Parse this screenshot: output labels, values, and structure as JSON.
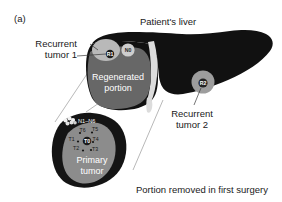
{
  "figure": {
    "panel_label": "(a)",
    "title": "Patient's liver",
    "caption": "Portion removed in first surgery"
  },
  "callouts": {
    "recurrent_tumor_1_line1": "Recurrent",
    "recurrent_tumor_1_line2": "tumor 1",
    "recurrent_tumor_2_line1": "Recurrent",
    "recurrent_tumor_2_line2": "tumor 2"
  },
  "regions": {
    "regenerated_line1": "Regenerated",
    "regenerated_line2": "portion",
    "primary_tumor_line1": "Primary",
    "primary_tumor_line2": "tumor"
  },
  "markers": {
    "recurrent_1": "R1",
    "recurrent_2": "R2",
    "node_0": "N0",
    "tumor_center": "T0",
    "lymph_nodes_range": "N1–N6"
  },
  "tumor_samples": [
    {
      "id": "T6",
      "x": 82.5,
      "y": 131.5,
      "dot_x": 80.0,
      "dot_y": 133.0
    },
    {
      "id": "T5",
      "x": 95.0,
      "y": 131.0,
      "dot_x": 92.0,
      "dot_y": 132.5
    },
    {
      "id": "T1",
      "x": 71.5,
      "y": 140.5,
      "dot_x": 78.0,
      "dot_y": 141.5
    },
    {
      "id": "T4",
      "x": 95.5,
      "y": 141.0,
      "dot_x": 93.0,
      "dot_y": 142.0
    },
    {
      "id": "T2",
      "x": 76.0,
      "y": 150.0,
      "dot_x": 83.0,
      "dot_y": 150.5
    },
    {
      "id": "T3",
      "x": 95.0,
      "y": 151.0,
      "dot_x": 91.0,
      "dot_y": 150.0
    }
  ],
  "colors": {
    "liver_dark": "#111111",
    "regenerated_gray": "#676767",
    "specimen_dark": "#141414",
    "tumor_gray": "#8c8c8c",
    "marker_light": "#b9b9b9",
    "vessel_light": "#dcdcdc",
    "text": "#1a1a1a",
    "background": "#ffffff"
  }
}
